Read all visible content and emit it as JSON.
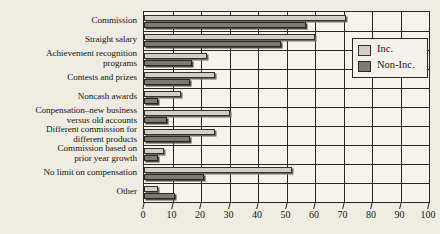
{
  "chart_data": {
    "type": "bar",
    "orientation": "horizontal",
    "title": "",
    "subtitle": "",
    "xlabel": "",
    "ylabel": "",
    "xlim": [
      0,
      100
    ],
    "xticks": [
      0,
      10,
      20,
      30,
      40,
      50,
      60,
      70,
      80,
      90,
      100
    ],
    "xtick_labels": [
      "0",
      "10",
      "20",
      "30",
      "40",
      "50",
      "60",
      "70",
      "80",
      "90",
      "100"
    ],
    "grid": true,
    "grid_axis": "x",
    "legend_position": "upper right",
    "categories": [
      "Commission",
      "Straight salary",
      "Achievement recognition programs",
      "Contests and prizes",
      "Noncash awards",
      "Conpensation–new business versus old accounts",
      "Different commission for different products",
      "Commission based on prior year growth",
      "No limit on compensation",
      "Other"
    ],
    "category_lines": [
      [
        "Commission"
      ],
      [
        "Straight salary"
      ],
      [
        "Achievement recognition",
        "programs"
      ],
      [
        "Contests and prizes"
      ],
      [
        "Noncash awards"
      ],
      [
        "Conpensation–new business",
        "versus old accounts"
      ],
      [
        "Different commission for",
        "different products"
      ],
      [
        "Commission based on",
        "prior year growth"
      ],
      [
        "No limit on compensation"
      ],
      [
        "Other"
      ]
    ],
    "series": [
      {
        "name": "Inc.",
        "color": "#d2cfc6",
        "values": [
          71,
          60,
          22,
          25,
          13,
          30,
          25,
          7,
          52,
          5
        ]
      },
      {
        "name": "Non-Inc.",
        "color": "#7d7a73",
        "values": [
          57,
          48,
          17,
          16,
          5,
          8,
          16,
          5,
          21,
          11
        ]
      }
    ]
  },
  "legend": {
    "items": [
      {
        "label": "Inc."
      },
      {
        "label": "Non-Inc."
      }
    ]
  }
}
